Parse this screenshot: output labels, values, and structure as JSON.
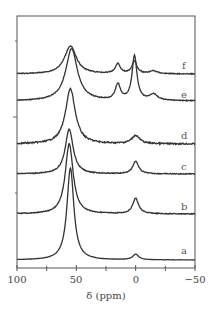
{
  "chart_data": {
    "type": "line",
    "title": "",
    "xlabel": "δ (ppm)",
    "ylabel": "",
    "xlim": [
      100,
      -50
    ],
    "x_reversed": true,
    "x_ticks": [
      100,
      50,
      0,
      -50
    ],
    "x_tick_labels": [
      "100",
      "50",
      "0",
      "−50"
    ],
    "x_minor_ticks": [
      75,
      25,
      -25
    ],
    "grid": false,
    "legend": "none; traces labeled inline at right",
    "stacked_offset": true,
    "series": [
      {
        "name": "a",
        "peaks": [
          {
            "x": 55,
            "rel_height": 1.0,
            "width": 3.5
          },
          {
            "x": 0,
            "rel_height": 0.06,
            "width": 3
          }
        ]
      },
      {
        "name": "b",
        "peaks": [
          {
            "x": 56,
            "rel_height": 1.0,
            "width": 4
          },
          {
            "x": 0,
            "rel_height": 0.22,
            "width": 3
          }
        ]
      },
      {
        "name": "c",
        "peaks": [
          {
            "x": 56,
            "rel_height": 1.0,
            "width": 4
          },
          {
            "x": 0,
            "rel_height": 0.28,
            "width": 3
          }
        ]
      },
      {
        "name": "d",
        "peaks": [
          {
            "x": 55,
            "rel_height": 1.0,
            "width": 5
          },
          {
            "x": 0,
            "rel_height": 0.15,
            "width": 4
          }
        ]
      },
      {
        "name": "e",
        "peaks": [
          {
            "x": 54,
            "rel_height": 1.0,
            "width": 6
          },
          {
            "x": 15,
            "rel_height": 0.3,
            "width": 2.5
          },
          {
            "x": 1,
            "rel_height": 0.85,
            "width": 2.5
          },
          {
            "x": -15,
            "rel_height": 0.12,
            "width": 4
          }
        ]
      },
      {
        "name": "f",
        "peaks": [
          {
            "x": 55,
            "rel_height": 1.0,
            "width": 6
          },
          {
            "x": 15,
            "rel_height": 0.35,
            "width": 2.5
          },
          {
            "x": 1,
            "rel_height": 0.45,
            "width": 2.5
          },
          {
            "x": -15,
            "rel_height": 0.1,
            "width": 4
          }
        ]
      }
    ]
  },
  "labels": {
    "x_axis_title": "δ (ppm)",
    "tick_100": "100",
    "tick_50": "50",
    "tick_0": "0",
    "tick_m50": "−50",
    "trace_a": "a",
    "trace_b": "b",
    "trace_c": "c",
    "trace_d": "d",
    "trace_e": "e",
    "trace_f": "f"
  }
}
